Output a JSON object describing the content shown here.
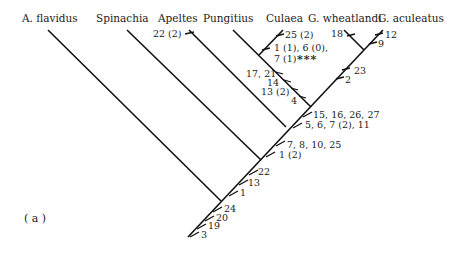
{
  "panel_label": "( a )",
  "taxa": [
    {
      "id": "flavidus",
      "label": "A. flavidus"
    },
    {
      "id": "spinachia",
      "label": "Spinachia"
    },
    {
      "id": "apeltes",
      "label": "Apeltes"
    },
    {
      "id": "pungitius",
      "label": "Pungitius"
    },
    {
      "id": "culaea",
      "label": "Culaea"
    },
    {
      "id": "wheatlandi",
      "label": "G. wheatlandi"
    },
    {
      "id": "aculeatus",
      "label": "G. aculeatus"
    }
  ],
  "characters": {
    "root": [
      "24",
      "20",
      "19",
      "3"
    ],
    "after_flavidus": [
      "22",
      "13",
      "1"
    ],
    "after_spinachia": [
      "7, 8, 10, 25",
      "1 (2)"
    ],
    "apeltes": "22 (2)",
    "after_apeltes": [
      "15, 16, 26, 27",
      "5, 6, 7 (2), 11"
    ],
    "pungitius_culaea_clade": [
      "17, 21",
      "14",
      "13 (2)",
      "4"
    ],
    "culaea": [
      "25 (2)",
      "1 (1), 6 (0),",
      "7 (1)"
    ],
    "culaea_marker": "***",
    "gasterosteus_clade": [
      "23",
      "2"
    ],
    "wheatlandi": "18",
    "aculeatus": [
      "12",
      "9"
    ]
  }
}
